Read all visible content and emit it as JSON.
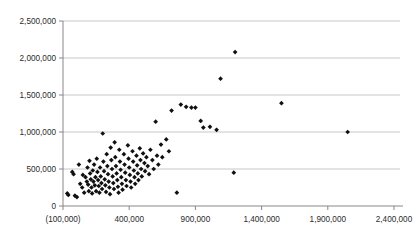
{
  "chart_data": {
    "type": "scatter",
    "title": "",
    "subtitle": "",
    "xlabel": "",
    "ylabel": "",
    "xlim": [
      -100000,
      2400000
    ],
    "ylim": [
      0,
      2500000
    ],
    "grid": true,
    "grid_axis": "y",
    "legend": "none",
    "marker": "diamond",
    "marker_color": "#101010",
    "x_tick_labels": [
      "(100,000)",
      "400,000",
      "900,000",
      "1,400,000",
      "1,900,000",
      "2,400,000"
    ],
    "x_tick_values": [
      -100000,
      400000,
      900000,
      1400000,
      1900000,
      2400000
    ],
    "y_tick_labels": [
      "0",
      "500,000",
      "1,000,000",
      "1,500,000",
      "2,000,000",
      "2,500,000"
    ],
    "y_tick_values": [
      0,
      500000,
      1000000,
      1500000,
      2000000,
      2500000
    ],
    "points": [
      [
        -68000,
        170000
      ],
      [
        -60000,
        150000
      ],
      [
        -30000,
        460000
      ],
      [
        -20000,
        430000
      ],
      [
        -10000,
        140000
      ],
      [
        5000,
        120000
      ],
      [
        20000,
        560000
      ],
      [
        30000,
        300000
      ],
      [
        45000,
        250000
      ],
      [
        50000,
        420000
      ],
      [
        60000,
        180000
      ],
      [
        70000,
        390000
      ],
      [
        80000,
        330000
      ],
      [
        85000,
        520000
      ],
      [
        90000,
        290000
      ],
      [
        95000,
        200000
      ],
      [
        100000,
        610000
      ],
      [
        105000,
        440000
      ],
      [
        110000,
        360000
      ],
      [
        115000,
        250000
      ],
      [
        120000,
        170000
      ],
      [
        125000,
        480000
      ],
      [
        130000,
        330000
      ],
      [
        135000,
        560000
      ],
      [
        140000,
        280000
      ],
      [
        145000,
        390000
      ],
      [
        150000,
        200000
      ],
      [
        155000,
        640000
      ],
      [
        160000,
        460000
      ],
      [
        165000,
        350000
      ],
      [
        170000,
        270000
      ],
      [
        175000,
        180000
      ],
      [
        180000,
        520000
      ],
      [
        185000,
        400000
      ],
      [
        190000,
        310000
      ],
      [
        195000,
        230000
      ],
      [
        200000,
        980000
      ],
      [
        205000,
        600000
      ],
      [
        210000,
        470000
      ],
      [
        215000,
        360000
      ],
      [
        220000,
        280000
      ],
      [
        225000,
        190000
      ],
      [
        230000,
        700000
      ],
      [
        235000,
        540000
      ],
      [
        240000,
        430000
      ],
      [
        245000,
        330000
      ],
      [
        250000,
        250000
      ],
      [
        255000,
        160000
      ],
      [
        260000,
        790000
      ],
      [
        265000,
        620000
      ],
      [
        270000,
        500000
      ],
      [
        275000,
        400000
      ],
      [
        280000,
        310000
      ],
      [
        285000,
        230000
      ],
      [
        290000,
        860000
      ],
      [
        295000,
        660000
      ],
      [
        300000,
        540000
      ],
      [
        305000,
        440000
      ],
      [
        310000,
        350000
      ],
      [
        315000,
        260000
      ],
      [
        320000,
        180000
      ],
      [
        325000,
        760000
      ],
      [
        330000,
        600000
      ],
      [
        335000,
        490000
      ],
      [
        340000,
        390000
      ],
      [
        345000,
        300000
      ],
      [
        350000,
        220000
      ],
      [
        360000,
        700000
      ],
      [
        365000,
        560000
      ],
      [
        370000,
        450000
      ],
      [
        375000,
        350000
      ],
      [
        380000,
        270000
      ],
      [
        390000,
        820000
      ],
      [
        395000,
        640000
      ],
      [
        400000,
        520000
      ],
      [
        405000,
        420000
      ],
      [
        410000,
        330000
      ],
      [
        415000,
        250000
      ],
      [
        425000,
        740000
      ],
      [
        430000,
        600000
      ],
      [
        435000,
        480000
      ],
      [
        440000,
        390000
      ],
      [
        445000,
        300000
      ],
      [
        455000,
        680000
      ],
      [
        460000,
        550000
      ],
      [
        465000,
        440000
      ],
      [
        470000,
        350000
      ],
      [
        480000,
        780000
      ],
      [
        485000,
        620000
      ],
      [
        490000,
        500000
      ],
      [
        495000,
        400000
      ],
      [
        505000,
        710000
      ],
      [
        515000,
        580000
      ],
      [
        520000,
        470000
      ],
      [
        530000,
        660000
      ],
      [
        540000,
        540000
      ],
      [
        550000,
        430000
      ],
      [
        560000,
        760000
      ],
      [
        575000,
        620000
      ],
      [
        585000,
        500000
      ],
      [
        600000,
        1140000
      ],
      [
        610000,
        680000
      ],
      [
        620000,
        560000
      ],
      [
        640000,
        830000
      ],
      [
        650000,
        660000
      ],
      [
        680000,
        900000
      ],
      [
        700000,
        740000
      ],
      [
        720000,
        1290000
      ],
      [
        760000,
        180000
      ],
      [
        790000,
        1370000
      ],
      [
        830000,
        1340000
      ],
      [
        870000,
        1330000
      ],
      [
        900000,
        1330000
      ],
      [
        940000,
        1150000
      ],
      [
        960000,
        1060000
      ],
      [
        1010000,
        1070000
      ],
      [
        1060000,
        1030000
      ],
      [
        1090000,
        1720000
      ],
      [
        1200000,
        2080000
      ],
      [
        1190000,
        450000
      ],
      [
        1550000,
        1390000
      ],
      [
        2050000,
        1000000
      ]
    ]
  }
}
